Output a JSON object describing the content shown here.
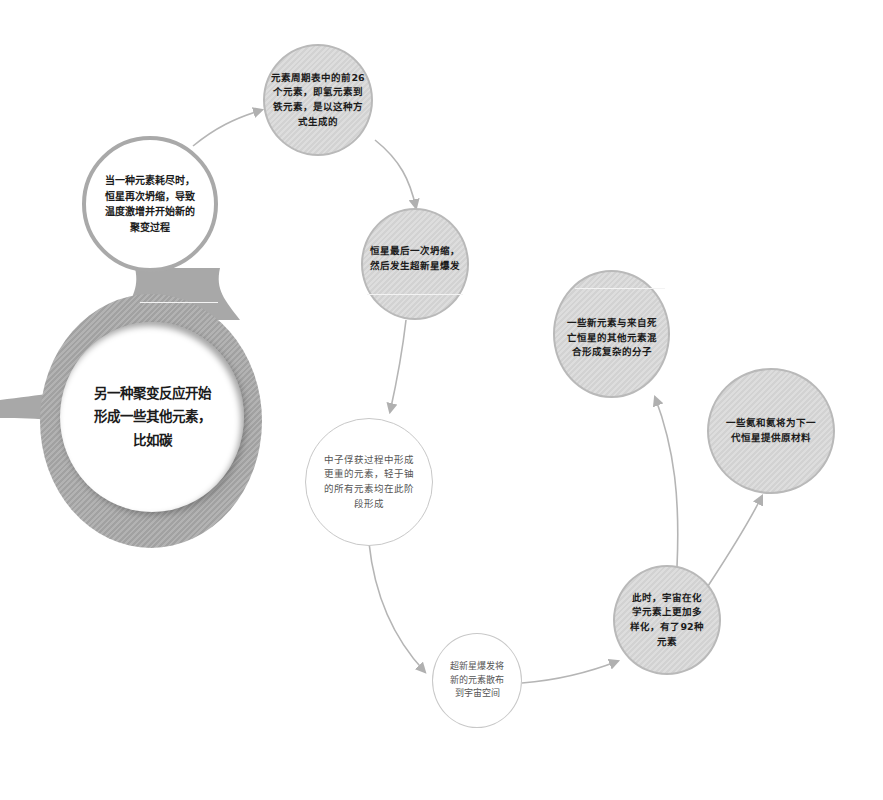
{
  "diagram": {
    "title": "",
    "nodes": [
      {
        "id": "n1",
        "text": "当一种元素耗尽时，\n恒星再次坍缩，导致\n温度激增并开始新的\n聚变过程",
        "style": "white-ring"
      },
      {
        "id": "n2",
        "text": "元素周期表中的前26\n个元素，即氢元素到\n铁元素，是以这种方\n式生成的",
        "style": "gray-striped"
      },
      {
        "id": "n3",
        "text": "恒星最后一次坍缩，\n然后发生超新星爆发",
        "style": "gray-striped"
      },
      {
        "id": "n4",
        "text": "中子俘获过程中形成\n更重的元素，轻于铀\n的所有元素均在此阶\n段形成",
        "style": "white-outline"
      },
      {
        "id": "n5",
        "text": "超新星爆发将\n新的元素散布\n到宇宙空间",
        "style": "white-outline"
      },
      {
        "id": "n6",
        "text": "此时，宇宙在化\n学元素上更加多\n样化，有了92种\n元素",
        "style": "gray-striped"
      },
      {
        "id": "n7",
        "text": "一些新元素与来自死\n亡恒星的其他元素混\n合形成复杂的分子",
        "style": "gray-striped"
      },
      {
        "id": "n8",
        "text": "一些氦和氦将为下一\n代恒星提供原材料",
        "style": "gray-striped"
      },
      {
        "id": "n0",
        "text": "另一种聚变反应开始\n形成一些其他元素，\n比如碳",
        "style": "big-ring"
      }
    ],
    "edges": [
      {
        "from": "n1",
        "to": "n2"
      },
      {
        "from": "n2",
        "to": "n3"
      },
      {
        "from": "n3",
        "to": "n4"
      },
      {
        "from": "n4",
        "to": "n5"
      },
      {
        "from": "n5",
        "to": "n6"
      },
      {
        "from": "n6",
        "to": "n7"
      },
      {
        "from": "n6",
        "to": "n8"
      }
    ],
    "colors": {
      "node_fill": "#d6d6d6",
      "node_border": "#b9b9b9",
      "ring": "#a8a8a8",
      "arrow": "#b0b0b0",
      "text": "#1b1b1b",
      "light_text": "#555555"
    }
  }
}
